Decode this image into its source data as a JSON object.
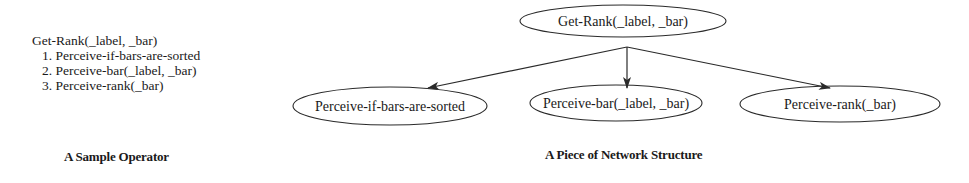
{
  "operator": {
    "name": "Get-Rank(_label, _bar)",
    "steps": [
      "1. Perceive-if-bars-are-sorted",
      "2. Perceive-bar(_label, _bar)",
      "3. Perceive-rank(_bar)"
    ],
    "caption": "A Sample Operator"
  },
  "network": {
    "root": {
      "label": "Get-Rank(_label, _bar)"
    },
    "children": [
      {
        "label": "Perceive-if-bars-are-sorted"
      },
      {
        "label": "Perceive-bar(_label, _bar)"
      },
      {
        "label": "Perceive-rank(_bar)"
      }
    ],
    "edges": [
      {
        "from": "Get-Rank(_label, _bar)",
        "to": "Perceive-if-bars-are-sorted"
      },
      {
        "from": "Get-Rank(_label, _bar)",
        "to": "Perceive-bar(_label, _bar)"
      },
      {
        "from": "Get-Rank(_label, _bar)",
        "to": "Perceive-rank(_bar)"
      }
    ],
    "caption": "A Piece of Network Structure"
  },
  "colors": {
    "stroke": "#2a2a2a",
    "text": "#1a1a1a",
    "background": "#ffffff"
  }
}
